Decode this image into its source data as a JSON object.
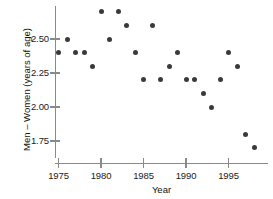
{
  "chart_data": {
    "type": "scatter",
    "title": "",
    "xlabel": "Year",
    "ylabel": "Men – Women (years of age)",
    "xlim": [
      1973.6,
      1998.9
    ],
    "ylim": [
      1.66,
      2.79
    ],
    "grid": false,
    "legend": "none",
    "xticks": [
      1975,
      1980,
      1985,
      1990,
      1995
    ],
    "xtick_labels": [
      "1975",
      "1980",
      "1985",
      "1990",
      "1995"
    ],
    "yticks": [
      1.75,
      2.0,
      2.25,
      2.5
    ],
    "ytick_labels": [
      "1.75",
      "2.00",
      "2.25",
      "2.50"
    ],
    "marker_color": "#3a3a3a",
    "axis_color": "#8a8a8a",
    "x": [
      1975,
      1976,
      1977,
      1978,
      1979,
      1980,
      1981,
      1982,
      1983,
      1984,
      1985,
      1986,
      1987,
      1988,
      1989,
      1990,
      1991,
      1992,
      1993,
      1994,
      1995,
      1996,
      1997,
      1998
    ],
    "y": [
      2.4,
      2.5,
      2.4,
      2.4,
      2.3,
      2.7,
      2.5,
      2.7,
      2.6,
      2.4,
      2.2,
      2.6,
      2.2,
      2.3,
      2.4,
      2.2,
      2.2,
      2.1,
      2.0,
      2.2,
      2.4,
      2.3,
      1.8,
      1.7
    ],
    "points": [
      {
        "year": 1975,
        "value": 2.4
      },
      {
        "year": 1976,
        "value": 2.5
      },
      {
        "year": 1977,
        "value": 2.4
      },
      {
        "year": 1978,
        "value": 2.4
      },
      {
        "year": 1979,
        "value": 2.3
      },
      {
        "year": 1980,
        "value": 2.7
      },
      {
        "year": 1981,
        "value": 2.5
      },
      {
        "year": 1982,
        "value": 2.7
      },
      {
        "year": 1983,
        "value": 2.6
      },
      {
        "year": 1984,
        "value": 2.4
      },
      {
        "year": 1985,
        "value": 2.2
      },
      {
        "year": 1986,
        "value": 2.6
      },
      {
        "year": 1987,
        "value": 2.2
      },
      {
        "year": 1988,
        "value": 2.3
      },
      {
        "year": 1989,
        "value": 2.4
      },
      {
        "year": 1990,
        "value": 2.2
      },
      {
        "year": 1991,
        "value": 2.2
      },
      {
        "year": 1992,
        "value": 2.1
      },
      {
        "year": 1993,
        "value": 2.0
      },
      {
        "year": 1994,
        "value": 2.2
      },
      {
        "year": 1995,
        "value": 2.4
      },
      {
        "year": 1996,
        "value": 2.3
      },
      {
        "year": 1997,
        "value": 1.8
      },
      {
        "year": 1998,
        "value": 1.7
      }
    ]
  },
  "axes": {
    "y_title": "Men – Women (years of age)",
    "x_title": "Year"
  },
  "clipped_caption": ""
}
